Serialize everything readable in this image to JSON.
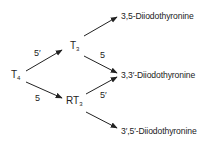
{
  "diagram": {
    "type": "metabolic-pathway",
    "nodes": {
      "t4": {
        "main": "T",
        "sub": "4"
      },
      "t3": {
        "main": "T",
        "sub": "3"
      },
      "rt3": {
        "main": "RT",
        "sub": "3"
      },
      "p35": {
        "label": "3,5-Diiodothyronine"
      },
      "p33": {
        "label": "3,3′-Diiodothyronine"
      },
      "p355": {
        "label": "3′,5′-Diiodothyronine"
      }
    },
    "edges": [
      {
        "from": "T4",
        "to": "T3",
        "label": "5′"
      },
      {
        "from": "T4",
        "to": "RT3",
        "label": "5"
      },
      {
        "from": "T3",
        "to": "3,5-Diiodothyronine",
        "label": ""
      },
      {
        "from": "T3",
        "to": "3,3′-Diiodothyronine",
        "label": "5"
      },
      {
        "from": "RT3",
        "to": "3,3′-Diiodothyronine",
        "label": "5′"
      },
      {
        "from": "RT3",
        "to": "3′,5′-Diiodothyronine",
        "label": ""
      }
    ],
    "edge_labels": {
      "t4_t3": "5′",
      "t4_rt3": "5",
      "t3_p33": "5",
      "rt3_p33": "5′"
    },
    "colors": {
      "ink": "#222222",
      "background": "#ffffff"
    }
  }
}
